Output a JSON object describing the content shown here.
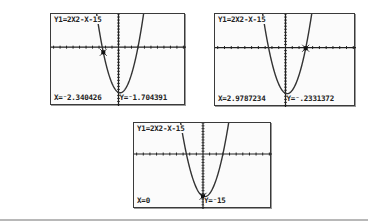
{
  "screens": [
    {
      "equation": "Y1=2X2-X-15",
      "x_readout": "X=⁻2.340426",
      "y_readout": "Y=⁻1.704391",
      "trace_point": {
        "x": -2.340426,
        "y": -1.704391
      }
    },
    {
      "equation": "Y1=2X2-X-15",
      "x_readout": "X=2.9787234",
      "y_readout": "Y=⁻.2331372",
      "trace_point": {
        "x": 2.9787234,
        "y": -0.2331372
      }
    },
    {
      "equation": "Y1=2X2-X-15",
      "x_readout": "X=0",
      "y_readout": "Y=⁻15",
      "trace_point": {
        "x": 0,
        "y": -15
      }
    }
  ],
  "colors": {
    "screen_bg": "#fbfbfb",
    "frame": "#3a3a3a",
    "curve": "#333333",
    "axis": "#222222"
  },
  "chart_data": [
    {
      "type": "line",
      "title": "Y1=2X2-X-15",
      "function": "y = 2x^2 - x - 15",
      "window": {
        "xmin": -10.4,
        "xmax": 10.4,
        "ymin": -19.5,
        "ymax": 11
      },
      "axis_ticks": "unit tick marks on both axes",
      "grid": false,
      "trace": {
        "x": -2.340426,
        "y": -1.704391
      },
      "annotations": [
        "X=-2.340426",
        "Y=-1.704391"
      ]
    },
    {
      "type": "line",
      "title": "Y1=2X2-X-15",
      "function": "y = 2x^2 - x - 15",
      "window": {
        "xmin": -10.4,
        "xmax": 10.4,
        "ymin": -19.5,
        "ymax": 11
      },
      "axis_ticks": "unit tick marks on both axes",
      "grid": false,
      "trace": {
        "x": 2.9787234,
        "y": -0.2331372
      },
      "annotations": [
        "X=2.9787234",
        "Y=-.2331372"
      ]
    },
    {
      "type": "line",
      "title": "Y1=2X2-X-15",
      "function": "y = 2x^2 - x - 15",
      "window": {
        "xmin": -10.4,
        "xmax": 10.4,
        "ymin": -19.5,
        "ymax": 11
      },
      "axis_ticks": "unit tick marks on both axes",
      "grid": false,
      "trace": {
        "x": 0,
        "y": -15
      },
      "annotations": [
        "X=0",
        "Y=-15"
      ]
    }
  ]
}
